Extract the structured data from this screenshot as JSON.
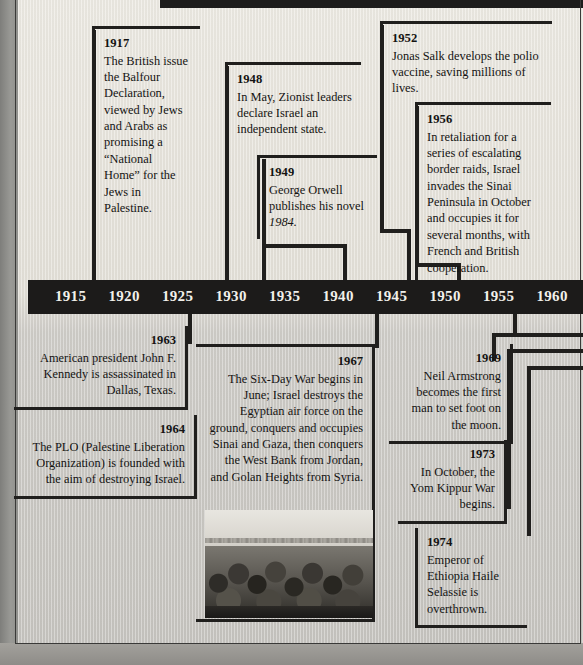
{
  "axis": {
    "label": "timeline-axis",
    "ticks": [
      "1915",
      "1920",
      "1925",
      "1930",
      "1935",
      "1940",
      "1945",
      "1950",
      "1955",
      "1960"
    ],
    "range_start": 1915,
    "range_end": 1960,
    "step": 5,
    "bar_color": "#1c1b1a",
    "text_color": "#f2f0ea"
  },
  "colors": {
    "page_background": "#e3e0d8",
    "ink": "#201f1d",
    "text": "#141312"
  },
  "events_above": [
    {
      "year": "1917",
      "text": "The British issue the Balfour Declaration, viewed by Jews and Arabs as promising a “National Home” for the Jews in Palestine."
    },
    {
      "year": "1948",
      "text": "In May, Zionist leaders declare Israel an independent state."
    },
    {
      "year": "1949",
      "text": "George Orwell publishes his novel ",
      "italic_tail": "1984."
    },
    {
      "year": "1952",
      "text": "Jonas Salk develops the polio vaccine, saving millions of lives."
    },
    {
      "year": "1956",
      "text": "In retaliation for a series of escalating border raids, Israel invades the Sinai Peninsula in October and occupies it for several months, with French and British cooperation."
    }
  ],
  "events_below": [
    {
      "year": "1963",
      "text": "American president John F. Kennedy is assassinated in Dallas, Texas."
    },
    {
      "year": "1964",
      "text": "The PLO (Palestine Liberation Organization) is founded with the aim of destroying Israel."
    },
    {
      "year": "1967",
      "text": "The Six-Day War begins in June; Israel destroys the Egyptian air force on the ground, conquers and occupies Sinai and Gaza, then conquers the West Bank from Jordan, and Golan Heights from Syria."
    },
    {
      "year": "1969",
      "text": "Neil Armstrong becomes the first man to set foot on the moon."
    },
    {
      "year": "1973",
      "text": "In October, the Yom Kippur War begins."
    },
    {
      "year": "1974",
      "text": "Emperor of Ethiopia Haile Selassie is overthrown."
    }
  ],
  "photo": {
    "caption": "",
    "description": "black-and-white photograph of a crowd of soldiers in a desert landscape"
  }
}
